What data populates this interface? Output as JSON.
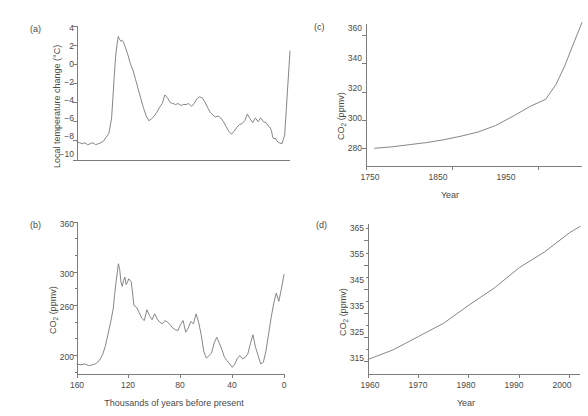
{
  "figure": {
    "background": "#ffffff",
    "line_color": "#78787c",
    "axis_color": "#7d7d7d",
    "text_color": "#4a4a4a"
  },
  "panels": {
    "a": {
      "label": "(a)",
      "ylabel_pre": "Local temperature change (",
      "ylabel_unit": "°C",
      "ylabel_post": ")",
      "ylabel_full": "Local temperature change (°C)",
      "yticks": [
        "4",
        "2",
        "0",
        "−2",
        "−4",
        "−6",
        "−8",
        "−10"
      ],
      "xticks": []
    },
    "b": {
      "label": "(b)",
      "ylabel_main": "CO",
      "ylabel_sub": "2",
      "ylabel_tail": " (ppmv)",
      "ylabel_full": "CO2 (ppmv)",
      "yticks": [
        "360",
        "300",
        "260",
        "200"
      ],
      "xticks": [
        "160",
        "120",
        "80",
        "40",
        "0"
      ],
      "xlabel": "Thousands of years before present"
    },
    "c": {
      "label": "(c)",
      "ylabel_main": "CO",
      "ylabel_sub": "2",
      "ylabel_tail": " (ppmv)",
      "ylabel_full": "CO2 (ppmv)",
      "yticks": [
        "360",
        "340",
        "320",
        "300",
        "280"
      ],
      "xticks": [
        "1750",
        "1850",
        "1950"
      ],
      "xlabel": "Year"
    },
    "d": {
      "label": "(d)",
      "ylabel_main": "CO",
      "ylabel_sub": "2",
      "ylabel_tail": " (ppmv)",
      "ylabel_full": "CO2 (ppmv)",
      "yticks": [
        "365",
        "355",
        "345",
        "335",
        "325",
        "315"
      ],
      "xticks": [
        "1960",
        "1970",
        "1980",
        "1990",
        "2000"
      ],
      "xlabel": "Year"
    }
  },
  "chart_data": [
    {
      "type": "line",
      "panel": "a",
      "title": "(a)",
      "xlabel": "Thousands of years before present",
      "ylabel": "Local temperature change (°C)",
      "xlim": [
        160,
        0
      ],
      "ylim": [
        -10,
        4
      ],
      "x_reversed": true,
      "grid": false,
      "legend": null,
      "yticks": [
        4,
        2,
        0,
        -2,
        -4,
        -6,
        -8,
        -10
      ],
      "xticks": [
        160,
        120,
        80,
        40,
        0
      ],
      "series": [
        {
          "name": "Local temperature change",
          "x": [
            160,
            158,
            156,
            154,
            152,
            150,
            148,
            146,
            144,
            142,
            140,
            138,
            136,
            134,
            133,
            132,
            131,
            130,
            129,
            128,
            127,
            126,
            125,
            124,
            123,
            122,
            120,
            118,
            116,
            114,
            112,
            110,
            108,
            106,
            104,
            102,
            100,
            98,
            96,
            94,
            92,
            90,
            88,
            86,
            84,
            82,
            80,
            78,
            76,
            74,
            72,
            70,
            68,
            66,
            64,
            62,
            60,
            58,
            56,
            54,
            52,
            50,
            48,
            46,
            44,
            42,
            40,
            38,
            36,
            34,
            32,
            30,
            28,
            26,
            24,
            22,
            20,
            18,
            17,
            16,
            15,
            14,
            13,
            12,
            11,
            10,
            8,
            6,
            4,
            2,
            0
          ],
          "y": [
            -8.1,
            -8.2,
            -8.3,
            -8.2,
            -8.4,
            -8.3,
            -8.2,
            -8.4,
            -8.3,
            -8.2,
            -8.0,
            -7.6,
            -7.2,
            -5.6,
            -3.4,
            -1.2,
            0.8,
            2.0,
            2.9,
            2.6,
            2.4,
            2.5,
            2.3,
            1.9,
            1.5,
            1.1,
            0.1,
            -0.6,
            -1.6,
            -2.6,
            -3.6,
            -4.6,
            -5.4,
            -5.9,
            -5.7,
            -5.4,
            -5.0,
            -4.5,
            -4.1,
            -3.2,
            -3.5,
            -4.0,
            -4.1,
            -4.2,
            -4.1,
            -4.3,
            -4.2,
            -4.2,
            -4.1,
            -4.4,
            -4.1,
            -3.6,
            -3.4,
            -3.5,
            -3.9,
            -4.5,
            -5.0,
            -5.3,
            -5.5,
            -5.4,
            -5.6,
            -6.0,
            -6.5,
            -7.0,
            -7.3,
            -7.0,
            -6.6,
            -6.3,
            -6.2,
            -5.9,
            -5.2,
            -5.7,
            -6.1,
            -5.6,
            -6.0,
            -5.6,
            -6.0,
            -6.1,
            -6.3,
            -6.5,
            -6.6,
            -6.9,
            -7.6,
            -7.8,
            -7.7,
            -8.0,
            -8.2,
            -8.3,
            -7.4,
            -3.0,
            1.4
          ]
        }
      ]
    },
    {
      "type": "line",
      "panel": "b",
      "title": "(b)",
      "xlabel": "Thousands of years before present",
      "ylabel": "CO2 (ppmv)",
      "xlim": [
        160,
        0
      ],
      "ylim": [
        178,
        360
      ],
      "x_reversed": true,
      "grid": false,
      "legend": null,
      "yticks": [
        360,
        340,
        320,
        300,
        280,
        260,
        240,
        220,
        200,
        180
      ],
      "ytick_labeled": [
        360,
        300,
        260,
        200
      ],
      "xticks": [
        160,
        120,
        80,
        40,
        0
      ],
      "series": [
        {
          "name": "CO2 concentration",
          "x": [
            160,
            157,
            154,
            151,
            148,
            146,
            144,
            142,
            140,
            138,
            136,
            134,
            132,
            131,
            130,
            129,
            128,
            127,
            126,
            125,
            124,
            123,
            122,
            121,
            120,
            118,
            116,
            114,
            112,
            110,
            108,
            106,
            104,
            102,
            100,
            98,
            96,
            94,
            92,
            90,
            88,
            86,
            84,
            82,
            80,
            78,
            76,
            74,
            72,
            70,
            68,
            66,
            64,
            62,
            60,
            58,
            56,
            54,
            52,
            50,
            48,
            46,
            44,
            42,
            40,
            38,
            36,
            34,
            32,
            30,
            28,
            26,
            24,
            22,
            20,
            18,
            16,
            14,
            12,
            10,
            8,
            6,
            4,
            2,
            0
          ],
          "y": [
            190,
            189,
            190,
            188,
            189,
            190,
            192,
            196,
            202,
            212,
            226,
            240,
            256,
            272,
            286,
            298,
            310,
            303,
            288,
            283,
            290,
            294,
            285,
            288,
            292,
            288,
            260,
            258,
            252,
            245,
            242,
            255,
            248,
            243,
            250,
            244,
            240,
            238,
            242,
            240,
            237,
            233,
            231,
            230,
            237,
            242,
            228,
            233,
            241,
            238,
            250,
            240,
            225,
            205,
            197,
            200,
            203,
            215,
            222,
            215,
            207,
            198,
            194,
            190,
            186,
            190,
            197,
            200,
            196,
            198,
            202,
            214,
            225,
            210,
            200,
            190,
            192,
            205,
            225,
            245,
            262,
            275,
            265,
            280,
            297
          ]
        }
      ]
    },
    {
      "type": "line",
      "panel": "c",
      "title": "(c)",
      "xlabel": "Year",
      "ylabel": "CO2 (ppmv)",
      "xlim": [
        1750,
        2000
      ],
      "ylim": [
        268,
        368
      ],
      "grid": false,
      "legend": null,
      "yticks": [
        360,
        340,
        320,
        300,
        280
      ],
      "xticks": [
        1750,
        1850,
        1950
      ],
      "series": [
        {
          "name": "Atmospheric CO2",
          "x": [
            1760,
            1780,
            1800,
            1820,
            1840,
            1860,
            1880,
            1900,
            1920,
            1940,
            1958,
            1970,
            1980,
            1990,
            2000
          ],
          "y": [
            280.5,
            281.5,
            283,
            284.5,
            286.5,
            289,
            292,
            296.5,
            303,
            310,
            315,
            325.5,
            338.5,
            354,
            369
          ]
        }
      ]
    },
    {
      "type": "line",
      "panel": "d",
      "title": "(d)",
      "xlabel": "Year",
      "ylabel": "CO2 (ppmv)",
      "xlim": [
        1960,
        2002
      ],
      "ylim": [
        310,
        372
      ],
      "grid": false,
      "legend": null,
      "yticks": [
        365,
        355,
        345,
        335,
        325,
        315
      ],
      "xticks": [
        1960,
        1970,
        1980,
        1990,
        2000
      ],
      "series": [
        {
          "name": "Atmospheric CO2",
          "x": [
            1960,
            1965,
            1970,
            1975,
            1980,
            1985,
            1990,
            1995,
            2000,
            2002
          ],
          "y": [
            316,
            320,
            325.5,
            331,
            338.5,
            345.5,
            354,
            360.5,
            368.5,
            371
          ]
        }
      ]
    }
  ]
}
